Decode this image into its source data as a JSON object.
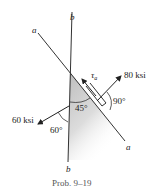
{
  "diagram": {
    "lines": {
      "a_label": "a",
      "b_label": "b"
    },
    "stresses": {
      "normal_x": "80 ksi",
      "normal_y": "60 ksi",
      "shear": "τ",
      "shear_sub": "a"
    },
    "angles": {
      "a": "45°",
      "b": "90°",
      "c": "60°"
    },
    "caption": "Prob. 9–19",
    "colors": {
      "line": "#333333",
      "shade": "#c8c8c8"
    }
  }
}
